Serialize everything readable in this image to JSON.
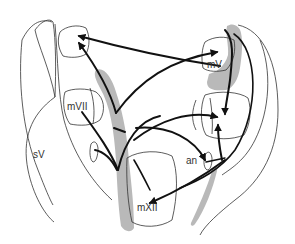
{
  "diagram": {
    "type": "neuroanatomy-projection-map",
    "colors": {
      "outline": "#333333",
      "arrow": "#111111",
      "shading": "#b8b8b8",
      "background": "#ffffff"
    },
    "labels": {
      "sV": "sV",
      "mVII": "mVII",
      "mV": "mV",
      "an": "an",
      "mXII": "mXII"
    },
    "nodes": [
      {
        "id": "sV",
        "label": "sV",
        "x": 36,
        "y": 155
      },
      {
        "id": "mVII",
        "label": "mVII",
        "x": 67,
        "y": 104
      },
      {
        "id": "mV",
        "label": "mV",
        "x": 207,
        "y": 62
      },
      {
        "id": "an",
        "label": "an",
        "x": 187,
        "y": 160
      },
      {
        "id": "mXII",
        "label": "mXII",
        "x": 138,
        "y": 205
      },
      {
        "id": "top-left-nucleus",
        "label": "",
        "x": 80,
        "y": 45
      },
      {
        "id": "right-mid-nucleus",
        "label": "",
        "x": 220,
        "y": 120
      }
    ]
  }
}
